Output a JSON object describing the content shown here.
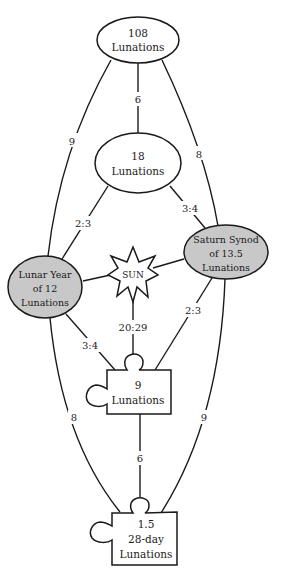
{
  "diagram": {
    "colors": {
      "stroke": "#1a1a1a",
      "plain_fill": "#ffffff",
      "shaded_fill": "#c8c8c8",
      "background": "#ffffff"
    },
    "nodes": {
      "n108": {
        "shape": "ellipse",
        "line1": "108",
        "line2": "Lunations"
      },
      "n18": {
        "shape": "ellipse",
        "line1": "18",
        "line2": "Lunations"
      },
      "lunar_year": {
        "shape": "ellipse-shaded",
        "line1": "Lunar Year",
        "line2": "of 12",
        "line3": "Lunations"
      },
      "saturn": {
        "shape": "ellipse-shaded",
        "line1": "Saturn Synod",
        "line2": "of 13.5",
        "line3": "Lunations"
      },
      "sun": {
        "shape": "star-8",
        "label": "SUN"
      },
      "n9": {
        "shape": "puzzle-piece",
        "line1": "9",
        "line2": "Lunations"
      },
      "n1_5": {
        "shape": "puzzle-piece",
        "line1": "1.5",
        "line2": "28-day",
        "line3": "Lunations"
      }
    },
    "edges": [
      {
        "from": "n108",
        "to": "n18",
        "label": "6"
      },
      {
        "from": "n108",
        "to": "lunar_year",
        "label": "9"
      },
      {
        "from": "n108",
        "to": "saturn",
        "label": "8"
      },
      {
        "from": "n18",
        "to": "lunar_year",
        "label": "2:3"
      },
      {
        "from": "n18",
        "to": "saturn",
        "label": "3:4"
      },
      {
        "from": "lunar_year",
        "to": "sun",
        "label": ""
      },
      {
        "from": "saturn",
        "to": "sun",
        "label": ""
      },
      {
        "from": "sun",
        "to": "n9",
        "label": "20:29"
      },
      {
        "from": "lunar_year",
        "to": "n9",
        "label": "3:4"
      },
      {
        "from": "saturn",
        "to": "n9",
        "label": "2:3"
      },
      {
        "from": "lunar_year",
        "to": "n1_5",
        "label": "8"
      },
      {
        "from": "saturn",
        "to": "n1_5",
        "label": "9"
      },
      {
        "from": "n9",
        "to": "n1_5",
        "label": "6"
      }
    ]
  }
}
